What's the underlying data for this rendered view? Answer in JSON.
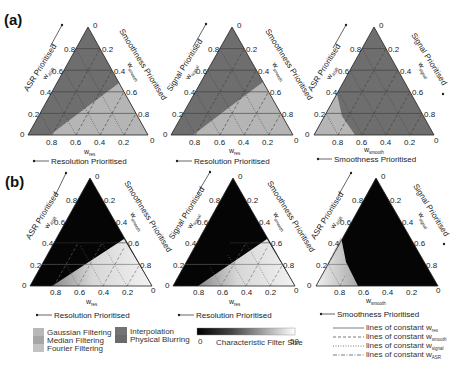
{
  "panels": {
    "a": {
      "label": "(a)"
    },
    "b": {
      "label": "(b)"
    }
  },
  "ticks": [
    "0",
    "0.2",
    "0.4",
    "0.6",
    "0.8"
  ],
  "ticks_bottom": [
    "0.8",
    "0.6",
    "0.4",
    "0.2",
    "0"
  ],
  "triangles": [
    {
      "left_title": "ASR Prioritised",
      "left_var": "w",
      "left_sub": "ASR",
      "right_title": "Smoothness Prioritised",
      "right_var": "w",
      "right_sub": "smooth",
      "bottom_var": "w",
      "bottom_sub": "res",
      "bottom_title": "Resolution Prioritised"
    },
    {
      "left_title": "Signal Prioritised",
      "left_var": "w",
      "left_sub": "signal",
      "right_title": "Smoothness Prioritised",
      "right_var": "w",
      "right_sub": "smooth",
      "bottom_var": "w",
      "bottom_sub": "res",
      "bottom_title": "Resolution Prioritised"
    },
    {
      "left_title": "ASR Prioritised",
      "left_var": "w",
      "left_sub": "ASR",
      "right_title": "Signal Prioritised",
      "right_var": "w",
      "right_sub": "signal",
      "bottom_var": "w",
      "bottom_sub": "smooth",
      "bottom_title": "Smoothness Prioritised"
    }
  ],
  "legend": {
    "methods": [
      {
        "label": "Gaussian Filtering",
        "color": "#b4b4b4"
      },
      {
        "label": "Median Filtering",
        "color": "#a6a6a6"
      },
      {
        "label": "Fourier Filtering",
        "color": "#bdbdbd"
      },
      {
        "label": "Interpolation",
        "color": "#747474"
      },
      {
        "label": "Physical Blurring",
        "color": "#6a6a6a"
      }
    ],
    "colorbar": {
      "min": "0",
      "max": "50",
      "label": "Characteristic Filter Size",
      "from": "#000000",
      "to": "#ffffff"
    },
    "lines": [
      {
        "label": "lines of constant w",
        "sub": "res",
        "style": "solid"
      },
      {
        "label": "lines of constant w",
        "sub": "smooth",
        "style": "dashed"
      },
      {
        "label": "lines of constant w",
        "sub": "signal",
        "style": "dotted"
      },
      {
        "label": "lines of constant w",
        "sub": "ASR",
        "style": "dashdot"
      }
    ]
  },
  "colors": {
    "dark_region": "#6e6e6e",
    "light_region": "#b5b5b5",
    "black_region": "#050505",
    "grid": "#3a3a3a"
  }
}
